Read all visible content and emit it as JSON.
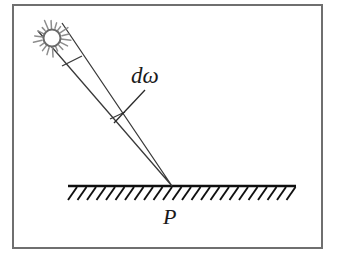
{
  "figure": {
    "kind": "optics-diagram",
    "background_color": "#ffffff",
    "ink_color": "#1a1a1a",
    "frame": {
      "name": "figure-border",
      "color": "#6f6f6f",
      "x": 13,
      "y": 5,
      "width": 309,
      "height": 243,
      "stroke_width": 2
    },
    "labels": {
      "solid_angle": "dω",
      "point": "P"
    },
    "light_source": {
      "name": "sun",
      "center_x": 52,
      "center_y": 38,
      "core_radius": 8.5,
      "ray_count": 18,
      "ray_inner": 9,
      "ray_outer": 19,
      "ray_color": "#8d8d8d",
      "core_stroke": "#6a6a6a"
    },
    "beam": {
      "apex_x": 172,
      "apex_y": 186,
      "top_left_x": 38,
      "top_left_y": 31,
      "top_right_x": 62,
      "top_right_y": 23,
      "stroke_color": "#3a3a3a",
      "stroke_width": 1.3,
      "bands": [
        {
          "name": "near-source-band",
          "x1": 62,
          "y1": 66,
          "x2": 82,
          "y2": 56
        },
        {
          "name": "solid-angle-band",
          "x1": 110,
          "y1": 119,
          "x2": 125,
          "y2": 112
        }
      ]
    },
    "leader": {
      "name": "domega-leader-line",
      "x1": 145,
      "y1": 90,
      "x2": 114,
      "y2": 123,
      "stroke_color": "#2a2a2a",
      "stroke_width": 1.3
    },
    "ground": {
      "name": "hatched-surface",
      "x_start": 68,
      "x_end": 296,
      "y": 186,
      "line_width": 2.4,
      "hatch_count": 24,
      "hatch_dx": 9,
      "hatch_dy": 13,
      "hatch_width": 1.9,
      "color": "#101010"
    }
  }
}
